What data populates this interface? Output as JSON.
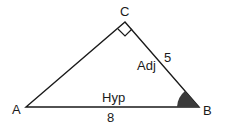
{
  "diagram": {
    "type": "right-triangle",
    "vertices": {
      "A": {
        "label": "A"
      },
      "B": {
        "label": "B"
      },
      "C": {
        "label": "C"
      }
    },
    "sides": {
      "AB": {
        "name": "Hyp",
        "length": "8"
      },
      "BC": {
        "name": "Adj",
        "length": "5"
      }
    },
    "right_angle_at": "C",
    "marked_angle_at": "B",
    "colors": {
      "stroke": "#1a1a1a",
      "angle_fill": "#3a3a3a"
    }
  }
}
